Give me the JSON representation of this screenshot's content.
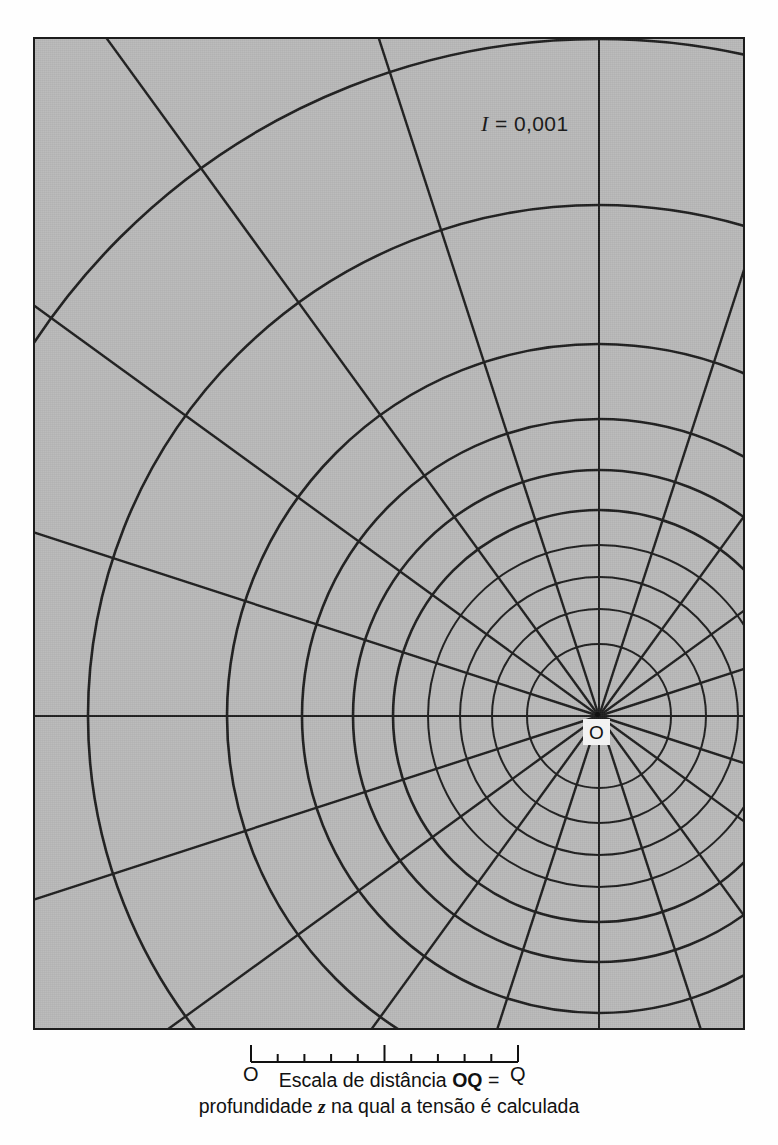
{
  "figure": {
    "type": "newmark-influence-chart",
    "background_color": "#b9b9b9",
    "line_color": "#1c1c1c",
    "frame": {
      "x": 33,
      "y": 37,
      "width": 712,
      "height": 993
    },
    "center_point": {
      "x": 597,
      "y": 714,
      "label": "O"
    },
    "influence_label": {
      "symbol": "I",
      "equals": "=",
      "value": "0,001",
      "full": "I = 0,001"
    },
    "radial_lines": 20,
    "radial_spacing_degrees": 18,
    "concentric_circles": 10
  },
  "chart_data": {
    "type": "scatter",
    "xlabel": "",
    "ylabel": "",
    "influence_value_per_element": 0.001,
    "n_radial_sectors": 20,
    "n_rings": 10,
    "sector_angle_deg": 18,
    "ring_radius_ratios_r_over_z": [
      0.27,
      0.4,
      0.52,
      0.64,
      0.77,
      0.92,
      1.11,
      1.39,
      1.91,
      2.53
    ],
    "ring_radii_px": [
      72,
      107,
      139,
      171,
      206,
      246,
      297,
      372,
      511,
      677
    ],
    "radial_angles_deg": [
      0,
      18,
      36,
      54,
      72,
      90,
      108,
      126,
      144,
      162,
      180,
      198,
      216,
      234,
      252,
      270,
      288,
      306,
      324,
      342
    ],
    "scale_bar": {
      "start_label": "O",
      "end_label": "Q",
      "divisions": 10,
      "length_px": 267,
      "major_tick_indices": [
        0,
        5,
        10
      ]
    },
    "legend": [
      "I = 0,001"
    ],
    "grid": false,
    "annotations": [
      "I = 0,001",
      "O",
      "Q",
      "Escala de distância OQ =",
      "profundidade z na qual a tensão é calculada"
    ]
  },
  "scale": {
    "o_label": "O",
    "q_label": "Q"
  },
  "caption": {
    "line1_prefix": "Escala de distância ",
    "line1_bold": "OQ",
    "line1_suffix": " =",
    "line2_prefix": "profundidade ",
    "line2_italic": "z",
    "line2_suffix": " na qual a tensão é calculada"
  }
}
